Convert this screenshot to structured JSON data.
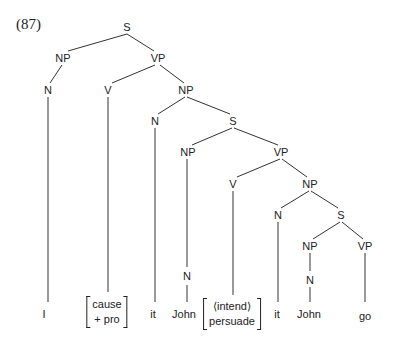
{
  "example_number": "(87)",
  "nodes": {
    "s1": "S",
    "np1": "NP",
    "vp1": "VP",
    "n1": "N",
    "v1": "V",
    "np2": "NP",
    "n2": "N",
    "s2": "S",
    "np3": "NP",
    "vp2": "VP",
    "v2": "V",
    "np4": "NP",
    "n3": "N",
    "n4": "N",
    "s3": "S",
    "np5": "NP",
    "vp3": "VP",
    "n5": "N"
  },
  "leaves": {
    "i": "I",
    "cause_top": "cause",
    "cause_bottom": "+ pro",
    "it1": "it",
    "john1": "John",
    "intend_top": "⟨intend⟩",
    "intend_bottom": "persuade",
    "it2": "it",
    "john2": "John",
    "go": "go"
  }
}
